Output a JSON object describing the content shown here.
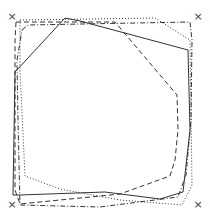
{
  "diagram": {
    "width": 210,
    "height": 218,
    "background": "#ffffff",
    "stroke_color": "#333333",
    "markers": [
      {
        "symbol": "×",
        "x": 12,
        "y": 17
      },
      {
        "symbol": "×",
        "x": 198,
        "y": 17
      },
      {
        "symbol": "×",
        "x": 12,
        "y": 205
      },
      {
        "symbol": "×",
        "x": 198,
        "y": 205
      }
    ],
    "polygons": [
      {
        "name": "solid-polygon",
        "style": "solid",
        "dasharray": "",
        "points": "15,72 65,18 80,21 188,50 190,130 183,192 160,199 105,192 20,195 13,195 15,72"
      },
      {
        "name": "dashed-polygon",
        "style": "dashed",
        "dasharray": "5,3",
        "points": "16,22 115,22 177,95 178,130 175,160 170,176 145,185 120,194 20,204 15,190 15,40 16,22"
      },
      {
        "name": "dotted-polygon",
        "style": "dotted",
        "dasharray": "1,2",
        "points": "20,20 155,18 190,40 192,185 182,205 120,200 60,189 25,176 20,70 20,20"
      },
      {
        "name": "dash-dot-polygon",
        "style": "dash-dot",
        "dasharray": "5,2,1,2",
        "points": "22,30 28,25 190,22 192,40 191,120 186,175 178,197 100,207 20,205 18,120 17,60 22,30"
      }
    ]
  }
}
